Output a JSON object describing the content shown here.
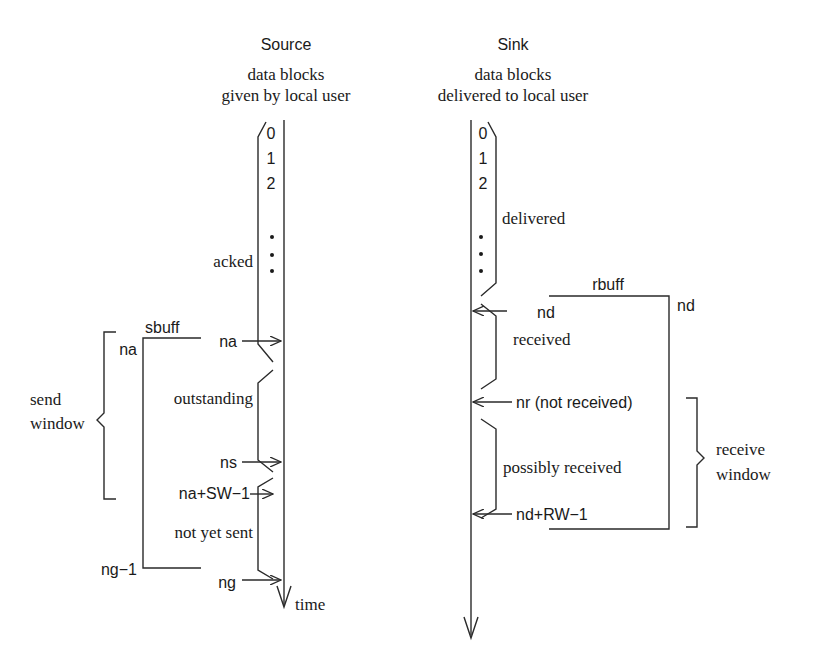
{
  "source": {
    "title": "Source",
    "subtitle_line1": "data blocks",
    "subtitle_line2": "given by local user",
    "block_numbers": [
      "0",
      "1",
      "2"
    ],
    "regions": {
      "acked": "acked",
      "outstanding": "outstanding",
      "not_yet_sent": "not yet sent"
    },
    "pointers": {
      "na": "na",
      "ns": "ns",
      "na_sw": "na+SW−1",
      "ng": "ng"
    },
    "buffer": {
      "label": "sbuff",
      "top_label": "na",
      "bottom_label": "ng−1"
    },
    "window": {
      "line1": "send",
      "line2": "window"
    },
    "time_label": "time"
  },
  "sink": {
    "title": "Sink",
    "subtitle_line1": "data blocks",
    "subtitle_line2": "delivered to local user",
    "block_numbers": [
      "0",
      "1",
      "2"
    ],
    "regions": {
      "delivered": "delivered",
      "received": "received",
      "possibly_received": "possibly received"
    },
    "pointers": {
      "nd": "nd",
      "nr": "nr (not received)",
      "nd_rw": "nd+RW−1"
    },
    "buffer": {
      "label": "rbuff",
      "top_label": "nd"
    },
    "window": {
      "line1": "receive",
      "line2": "window"
    }
  }
}
